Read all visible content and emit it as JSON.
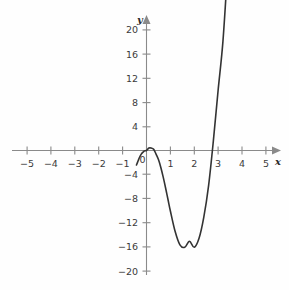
{
  "chart_data": {
    "type": "line",
    "title": "",
    "subtitle": "",
    "xlabel": "x",
    "ylabel": "y",
    "xlim": [
      -5.6,
      5.6
    ],
    "ylim": [
      -21.5,
      21.5
    ],
    "grid": false,
    "legend": null,
    "x_ticks": [
      -5,
      -4,
      -3,
      -2,
      -1,
      0,
      1,
      2,
      3,
      4,
      5
    ],
    "x_tick_labels": [
      "−5",
      "−4",
      "−3",
      "−2",
      "−1",
      "0",
      "1",
      "2",
      "3",
      "4",
      "5"
    ],
    "y_ticks": [
      -20,
      -16,
      -12,
      -8,
      -4,
      4,
      8,
      12,
      16,
      20
    ],
    "y_tick_labels": [
      "−20",
      "−16",
      "−12",
      "−8",
      "−4",
      "4",
      "8",
      "12",
      "16",
      "20"
    ],
    "series": [
      {
        "name": "cubic",
        "equation": "y = 4x^3 - 12x^2",
        "x": [
          -0.42,
          -0.35,
          -0.3,
          -0.25,
          -0.2,
          -0.15,
          -0.1,
          -0.05,
          0.0,
          0.1,
          0.2,
          0.3,
          0.4,
          0.5,
          0.6,
          0.7,
          0.8,
          0.9,
          1.0,
          1.2,
          1.4,
          1.6,
          1.8,
          2.0,
          2.2,
          2.4,
          2.6,
          2.8,
          3.0,
          3.2,
          3.4,
          3.55
        ],
        "y": [
          -2.4,
          -1.7,
          -1.2,
          -0.8,
          -0.5,
          -0.3,
          -0.1,
          -0.03,
          0.0,
          0.4,
          0.4,
          0.2,
          -0.6,
          -1.5,
          -2.8,
          -4.4,
          -6.2,
          -8.1,
          -10.0,
          -13.4,
          -15.6,
          -16.0,
          -15.0,
          -16.0,
          -14.5,
          -11.0,
          -5.8,
          1.6,
          10.0,
          18.0,
          30.0,
          38.0
        ],
        "local_max": {
          "x": 0.15,
          "y": 0.4
        },
        "local_min": {
          "x": 2.0,
          "y": -16.0
        },
        "x_intercepts": [
          0,
          3
        ],
        "color": "#333333"
      }
    ],
    "annotations": []
  },
  "axes": {
    "x_axis_label": "x",
    "y_axis_label": "y"
  }
}
